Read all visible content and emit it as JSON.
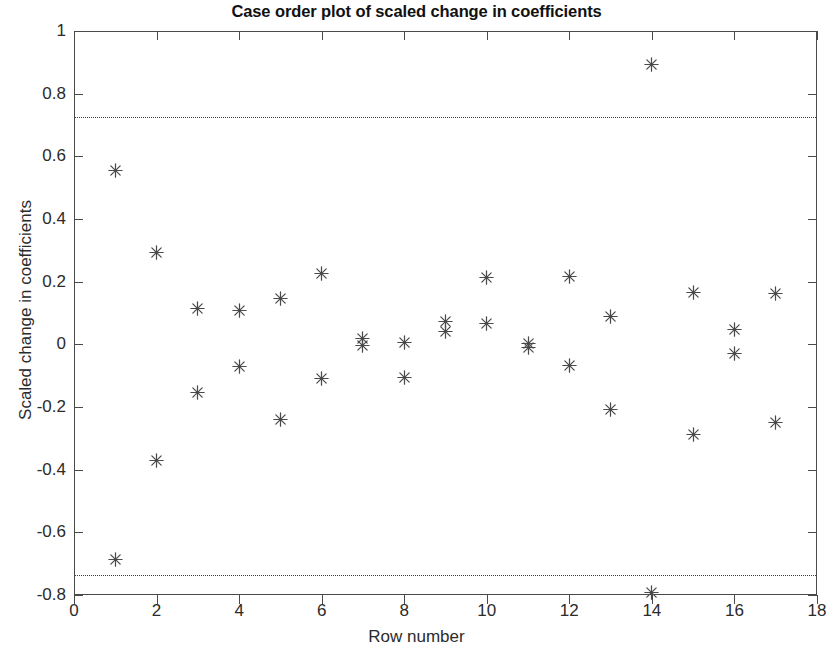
{
  "chart_data": {
    "type": "scatter",
    "title": "Case order plot of scaled change in coefficients",
    "xlabel": "Row number",
    "ylabel": "Scaled change in coefficients",
    "xlim": [
      0,
      18
    ],
    "ylim": [
      -0.8,
      1
    ],
    "xticks": [
      0,
      2,
      4,
      6,
      8,
      10,
      12,
      14,
      16,
      18
    ],
    "yticks": [
      -0.8,
      -0.6,
      -0.4,
      -0.2,
      0,
      0.2,
      0.4,
      0.6,
      0.8,
      1
    ],
    "xtick_labels": [
      "0",
      "2",
      "4",
      "6",
      "8",
      "10",
      "12",
      "14",
      "16",
      "18"
    ],
    "ytick_labels": [
      "-0.8",
      "-0.6",
      "-0.4",
      "-0.2",
      "0",
      "0.2",
      "0.4",
      "0.6",
      "0.8",
      "1"
    ],
    "grid": false,
    "legend": null,
    "marker": "asterisk",
    "marker_color": "#4a4a4a",
    "reference_lines": [
      {
        "name": "upper-threshold",
        "y": 0.725,
        "style": "dotted",
        "color": "#3b3b3b"
      },
      {
        "name": "lower-threshold",
        "y": -0.735,
        "style": "dotted",
        "color": "#3b3b3b"
      }
    ],
    "points": [
      {
        "x": 1,
        "y": 0.555
      },
      {
        "x": 1,
        "y": -0.688
      },
      {
        "x": 2,
        "y": 0.292
      },
      {
        "x": 2,
        "y": -0.372
      },
      {
        "x": 3,
        "y": 0.113
      },
      {
        "x": 3,
        "y": -0.154
      },
      {
        "x": 4,
        "y": 0.108
      },
      {
        "x": 4,
        "y": -0.072
      },
      {
        "x": 5,
        "y": 0.145
      },
      {
        "x": 5,
        "y": -0.241
      },
      {
        "x": 6,
        "y": 0.225
      },
      {
        "x": 6,
        "y": -0.109
      },
      {
        "x": 7,
        "y": 0.019
      },
      {
        "x": 7,
        "y": -0.003
      },
      {
        "x": 8,
        "y": 0.005
      },
      {
        "x": 8,
        "y": -0.105
      },
      {
        "x": 9,
        "y": 0.072
      },
      {
        "x": 9,
        "y": 0.041
      },
      {
        "x": 10,
        "y": 0.214
      },
      {
        "x": 10,
        "y": 0.065
      },
      {
        "x": 11,
        "y": 0.003
      },
      {
        "x": 11,
        "y": -0.009
      },
      {
        "x": 12,
        "y": 0.216
      },
      {
        "x": 12,
        "y": -0.067
      },
      {
        "x": 13,
        "y": 0.09
      },
      {
        "x": 13,
        "y": -0.208
      },
      {
        "x": 14,
        "y": 0.893
      },
      {
        "x": 14,
        "y": -0.793
      },
      {
        "x": 15,
        "y": 0.164
      },
      {
        "x": 15,
        "y": -0.287
      },
      {
        "x": 16,
        "y": 0.046
      },
      {
        "x": 16,
        "y": -0.03
      },
      {
        "x": 17,
        "y": 0.161
      },
      {
        "x": 17,
        "y": -0.248
      }
    ]
  }
}
